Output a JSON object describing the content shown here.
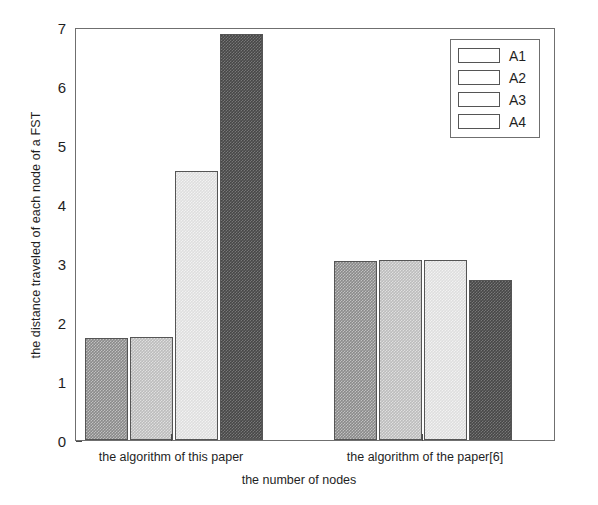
{
  "chart_data": {
    "type": "bar",
    "title": "",
    "xlabel": "the number of nodes",
    "ylabel": "the distance traveled of each node of a FST",
    "categories": [
      "the algorithm of this paper",
      "the algorithm of the paper[6]"
    ],
    "series": [
      {
        "name": "A1",
        "values": [
          1.74,
          3.05
        ],
        "color": "#8a8a8a"
      },
      {
        "name": "A2",
        "values": [
          1.76,
          3.06
        ],
        "color": "#bcbcbc"
      },
      {
        "name": "A3",
        "values": [
          4.58,
          3.06
        ],
        "color": "#dedede"
      },
      {
        "name": "A4",
        "values": [
          6.92,
          2.73
        ],
        "color": "#474747"
      }
    ],
    "ylim": [
      0,
      7
    ],
    "yticks": [
      0,
      1,
      2,
      3,
      4,
      5,
      6,
      7
    ],
    "yticklabels": [
      "0",
      "1",
      "2",
      "3",
      "4",
      "5",
      "6",
      "7"
    ],
    "grid": false,
    "legend_position": "top-right",
    "legend_entries": [
      "A1",
      "A2",
      "A3",
      "A4"
    ]
  }
}
